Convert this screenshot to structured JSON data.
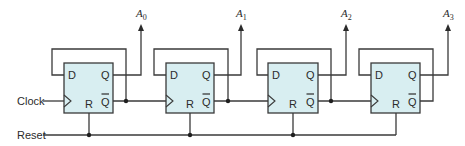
{
  "diagram": {
    "colors": {
      "box_fill": "#d8eef1",
      "wire": "#3a3a3a",
      "text": "#2b2b2b"
    },
    "inputs": {
      "clock_label": "Clock",
      "reset_label": "Reset"
    },
    "pin_labels": {
      "d": "D",
      "q": "Q",
      "qbar": "Q",
      "r": "R"
    },
    "flip_flops": [
      {
        "id": "ff0",
        "output_base": "A",
        "output_sub": "0"
      },
      {
        "id": "ff1",
        "output_base": "A",
        "output_sub": "1"
      },
      {
        "id": "ff2",
        "output_base": "A",
        "output_sub": "2"
      },
      {
        "id": "ff3",
        "output_base": "A",
        "output_sub": "3"
      }
    ]
  }
}
